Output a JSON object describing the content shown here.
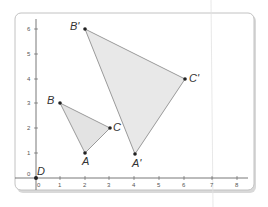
{
  "figure": {
    "type": "coordinate-plane-dilation",
    "axes": {
      "x_ticks": [
        "0",
        "1",
        "2",
        "3",
        "4",
        "5",
        "6",
        "7",
        "8"
      ],
      "y_ticks": [
        "0",
        "1",
        "2",
        "3",
        "4",
        "5",
        "6"
      ],
      "origin_label": "D"
    },
    "triangles": [
      {
        "name": "ABC",
        "points": [
          {
            "label": "A",
            "x": 2,
            "y": 1
          },
          {
            "label": "B",
            "x": 1,
            "y": 3
          },
          {
            "label": "C",
            "x": 3,
            "y": 2
          }
        ]
      },
      {
        "name": "A'B'C'",
        "points": [
          {
            "label": "A'",
            "x": 4,
            "y": 2
          },
          {
            "label": "B'",
            "x": 2,
            "y": 6
          },
          {
            "label": "C'",
            "x": 6,
            "y": 4
          }
        ]
      }
    ],
    "colors": {
      "fill": "#e6e6e6",
      "stroke": "#9a9a9a",
      "axis": "#444444",
      "frame": "#bdbdbd"
    }
  }
}
